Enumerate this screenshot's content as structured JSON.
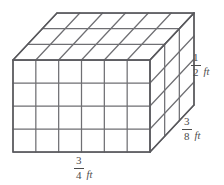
{
  "figure": {
    "type": "rectangular-prism-unit-cube-grid",
    "grid": {
      "columns_across_front": 6,
      "rows_down_front": 4,
      "cubes_deep": 3,
      "total_cubes": 72
    },
    "geometry": {
      "front_left_x": 13,
      "front_right_x": 150,
      "front_top_y": 60,
      "front_bottom_y": 152,
      "depth_offset_x": 44,
      "depth_offset_y": -47
    },
    "style": {
      "line_color": "#6f6f73",
      "edge_color": "#58585c",
      "background": "#ffffff",
      "text_color": "#4b4b4b"
    }
  },
  "labels": {
    "height": {
      "numerator": "1",
      "denominator": "2",
      "unit": "ft",
      "edge": "vertical-right-edge"
    },
    "depth": {
      "numerator": "3",
      "denominator": "8",
      "unit": "ft",
      "edge": "depth-right-edge"
    },
    "width": {
      "numerator": "3",
      "denominator": "4",
      "unit": "ft",
      "edge": "bottom-front-edge"
    }
  }
}
